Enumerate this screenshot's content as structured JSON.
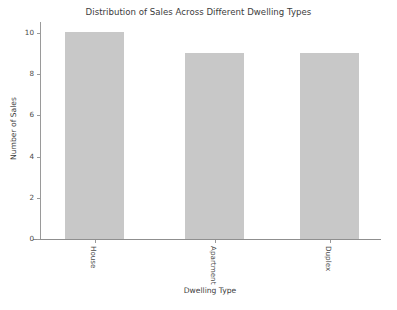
{
  "chart_data": {
    "type": "bar",
    "title": "Distribution of Sales Across Different Dwelling Types",
    "xlabel": "Dwelling Type",
    "ylabel": "Number of Sales",
    "categories": [
      "House",
      "Apartment",
      "Duplex"
    ],
    "values": [
      10,
      9,
      9
    ],
    "ylim": [
      0,
      10.5
    ],
    "yticks": [
      0,
      2,
      4,
      6,
      8,
      10
    ],
    "ytick_labels": [
      "0",
      "2",
      "4",
      "6",
      "8",
      "10"
    ],
    "grid": false,
    "legend": false,
    "bar_color": "#c8c8c8",
    "axis_color": "#9a9a9a",
    "text_color": "#3c3c3c",
    "background": "#ffffff",
    "xtick_rotation": 90
  }
}
